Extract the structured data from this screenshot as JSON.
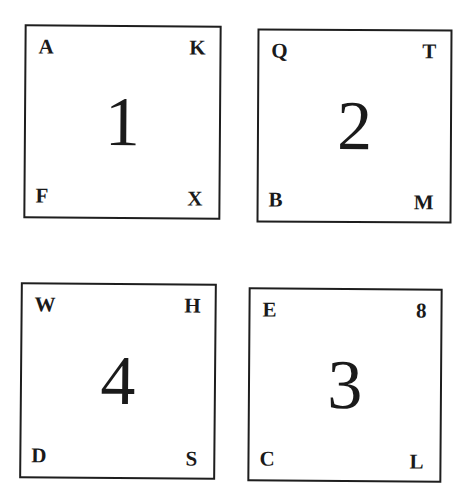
{
  "cards": [
    {
      "number": "1",
      "top_left": "A",
      "top_right": "K",
      "bottom_left": "F",
      "bottom_right": "X"
    },
    {
      "number": "2",
      "top_left": "Q",
      "top_right": "T",
      "bottom_left": "B",
      "bottom_right": "M"
    },
    {
      "number": "4",
      "top_left": "W",
      "top_right": "H",
      "bottom_left": "D",
      "bottom_right": "S"
    },
    {
      "number": "3",
      "top_left": "E",
      "top_right": "8",
      "bottom_left": "C",
      "bottom_right": "L"
    }
  ]
}
